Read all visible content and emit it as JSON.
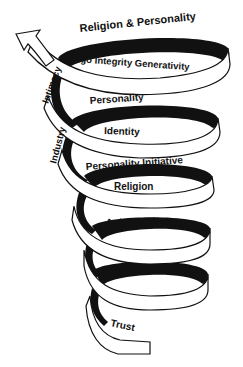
{
  "diagram": {
    "type": "spiral",
    "colors": {
      "ribbon_fill": "#ffffff",
      "ribbon_back": "#111111",
      "stroke": "#111111",
      "text": "#111111"
    },
    "labels": {
      "top_outer": "Religion & Personality",
      "top_inner": "Ego  Integrity Generativity",
      "intimacy": "Intimacy",
      "coil2_top": "Personality",
      "coil2_inner": "Identity",
      "industry": "Industry",
      "coil3_top": "Personality  Initiative",
      "coil3_inner": "Religion",
      "coil4_top": "Autonomy",
      "coil5_top": "Religion",
      "bottom": "Trust"
    }
  }
}
